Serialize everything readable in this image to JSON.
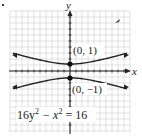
{
  "chart_data": {
    "type": "line",
    "title": "",
    "equation": "16y^2 - x^2 = 16",
    "equation_parts": {
      "a": "16y",
      "sup1": "2",
      "b": " − x",
      "sup2": "2",
      "c": " = 16"
    },
    "xlabel": "x",
    "ylabel": "y",
    "grid": true,
    "xlim": [
      -10,
      10
    ],
    "ylim": [
      -10,
      10
    ],
    "series": [
      {
        "name": "upper branch",
        "function": "y = sqrt(1 + x^2/16)",
        "x": [
          -10,
          -8,
          -6,
          -4,
          -2,
          0,
          2,
          4,
          6,
          8,
          10
        ],
        "values": [
          2.69,
          2.24,
          1.8,
          1.41,
          1.12,
          1.0,
          1.12,
          1.41,
          1.8,
          2.24,
          2.69
        ]
      },
      {
        "name": "lower branch",
        "function": "y = -sqrt(1 + x^2/16)",
        "x": [
          -10,
          -8,
          -6,
          -4,
          -2,
          0,
          2,
          4,
          6,
          8,
          10
        ],
        "values": [
          -2.69,
          -2.24,
          -1.8,
          -1.41,
          -1.12,
          -1.0,
          -1.12,
          -1.41,
          -1.8,
          -2.24,
          -2.69
        ]
      }
    ],
    "annotations": [
      {
        "point": [
          0,
          1
        ],
        "label": "(0, 1)"
      },
      {
        "point": [
          0,
          -1
        ],
        "label": "(0, −1)"
      }
    ]
  },
  "labels": {
    "x_axis": "x",
    "y_axis": "y",
    "vertex_upper": "(0, 1)",
    "vertex_lower": "(0, −1)"
  }
}
